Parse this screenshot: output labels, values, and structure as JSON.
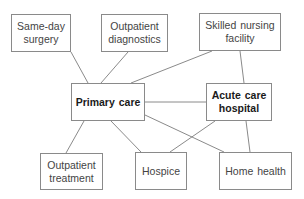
{
  "diagram": {
    "type": "network",
    "colors": {
      "border": "#8a8a8a",
      "text": "#444444",
      "bold_text": "#1a1a1a",
      "background": "#ffffff"
    },
    "nodes": [
      {
        "id": "same_day_surgery",
        "label": "Same-day surgery",
        "bold": false
      },
      {
        "id": "outpatient_diagnostics",
        "label": "Outpatient diagnostics",
        "bold": false
      },
      {
        "id": "skilled_nursing_facility",
        "label": "Skilled nursing facility",
        "bold": false
      },
      {
        "id": "primary_care",
        "label": "Primary care",
        "bold": true
      },
      {
        "id": "acute_care_hospital",
        "label": "Acute care hospital",
        "bold": true
      },
      {
        "id": "outpatient_treatment",
        "label": "Outpatient treatment",
        "bold": false
      },
      {
        "id": "hospice",
        "label": "Hospice",
        "bold": false
      },
      {
        "id": "home_health",
        "label": "Home health",
        "bold": false
      }
    ],
    "edges": [
      [
        "same_day_surgery",
        "primary_care"
      ],
      [
        "outpatient_diagnostics",
        "primary_care"
      ],
      [
        "skilled_nursing_facility",
        "primary_care"
      ],
      [
        "skilled_nursing_facility",
        "acute_care_hospital"
      ],
      [
        "primary_care",
        "acute_care_hospital"
      ],
      [
        "primary_care",
        "outpatient_treatment"
      ],
      [
        "primary_care",
        "hospice"
      ],
      [
        "primary_care",
        "home_health"
      ],
      [
        "acute_care_hospital",
        "hospice"
      ],
      [
        "acute_care_hospital",
        "home_health"
      ]
    ]
  }
}
